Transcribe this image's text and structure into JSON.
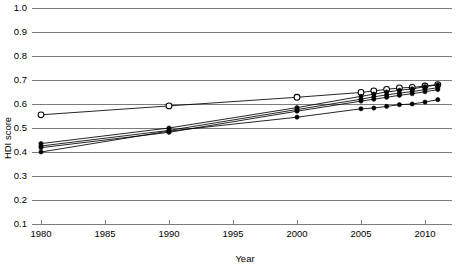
{
  "chart_data": {
    "type": "line",
    "title": "",
    "subtitle": "",
    "xlabel": "Year",
    "ylabel": "HDI score",
    "xlim": [
      1979.2,
      2011.8
    ],
    "ylim": [
      0.1,
      1.0
    ],
    "grid": true,
    "legend": "none",
    "x_ticks": [
      1980,
      1985,
      1990,
      1995,
      2000,
      2005,
      2010
    ],
    "x_tick_labels": [
      "1980",
      "1985",
      "1990",
      "1995",
      "2000",
      "2005",
      "2010"
    ],
    "y_ticks": [
      0.1,
      0.2,
      0.3,
      0.4,
      0.5,
      0.6,
      0.7,
      0.8,
      0.9,
      1.0
    ],
    "y_tick_labels": [
      "0.1",
      "0.2",
      "0.3",
      "0.4",
      "0.5",
      "0.6",
      "0.7",
      "0.8",
      "0.9",
      "1.0"
    ],
    "annotations": [],
    "series": [
      {
        "name": "series-open-upper",
        "marker": "open-circle",
        "x": [
          1980,
          1990,
          2000,
          2005,
          2006,
          2007,
          2008,
          2009,
          2010,
          2011
        ],
        "values": [
          0.555,
          0.592,
          0.628,
          0.648,
          0.655,
          0.661,
          0.667,
          0.669,
          0.675,
          0.681
        ]
      },
      {
        "name": "series-filled-a",
        "marker": "filled-circle",
        "x": [
          1980,
          1990,
          2000,
          2005,
          2006,
          2007,
          2008,
          2009,
          2010,
          2011
        ],
        "values": [
          0.435,
          0.5,
          0.585,
          0.632,
          0.641,
          0.65,
          0.657,
          0.663,
          0.672,
          0.68
        ]
      },
      {
        "name": "series-filled-b",
        "marker": "filled-circle",
        "x": [
          1980,
          1990,
          2000,
          2005,
          2006,
          2007,
          2008,
          2009,
          2010,
          2011
        ],
        "values": [
          0.425,
          0.49,
          0.577,
          0.62,
          0.63,
          0.638,
          0.645,
          0.652,
          0.66,
          0.668
        ]
      },
      {
        "name": "series-filled-c",
        "marker": "filled-circle",
        "x": [
          1980,
          1990,
          2000,
          2005,
          2006,
          2007,
          2008,
          2009,
          2010,
          2011
        ],
        "values": [
          0.418,
          0.482,
          0.57,
          0.612,
          0.62,
          0.628,
          0.636,
          0.643,
          0.651,
          0.66
        ]
      },
      {
        "name": "series-filled-lower",
        "marker": "filled-circle",
        "x": [
          1980,
          1990,
          2000,
          2005,
          2006,
          2007,
          2008,
          2009,
          2010,
          2011
        ],
        "values": [
          0.4,
          0.487,
          0.545,
          0.58,
          0.583,
          0.59,
          0.597,
          0.6,
          0.608,
          0.618
        ]
      }
    ]
  }
}
